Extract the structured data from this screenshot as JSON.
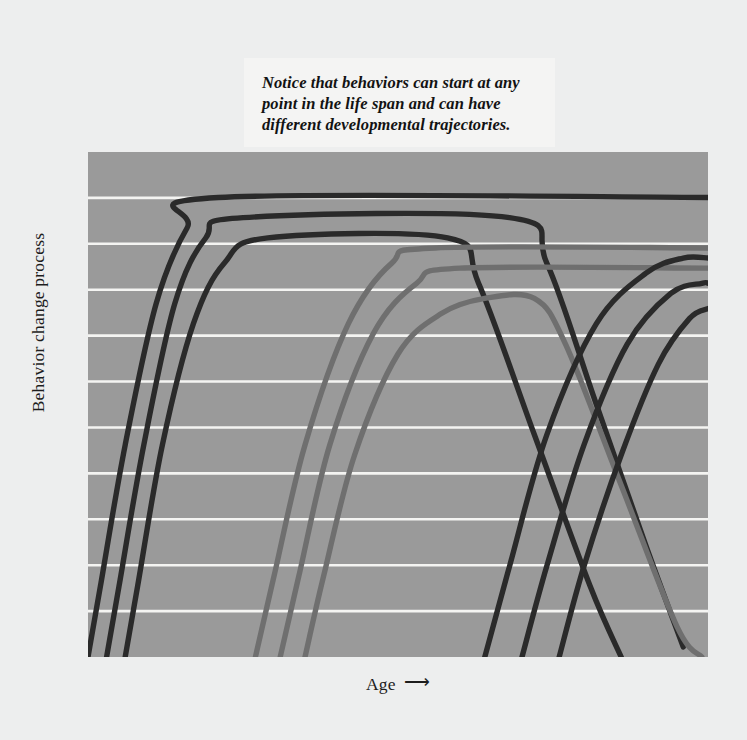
{
  "figure": {
    "background_color": "#edeeee",
    "plot_background_color": "#9a9a9a",
    "gridline_color": "#f4f4f2"
  },
  "axes": {
    "ylabel": "Behavior change process",
    "xlabel": "Age",
    "xlabel_arrow": "⟶"
  },
  "annotation": {
    "text": "Notice that behaviors can start at any point in the life span and can have different developmental trajectories."
  },
  "chart_data": {
    "type": "line",
    "title": "",
    "xlabel": "Age",
    "ylabel": "Behavior change process",
    "xlim": [
      0,
      100
    ],
    "ylim": [
      0,
      100
    ],
    "grid": true,
    "gridlines_horizontal": 10,
    "legend": "none",
    "axis_ticks_shown": false,
    "colors": {
      "dark_curve": "#2a2a2a",
      "gray_curve": "#6f6f6f",
      "plot_area": "#9a9a9a",
      "grid": "#f4f4f2"
    },
    "series": [
      {
        "name": "early-onset-1",
        "color": "#2a2a2a",
        "cluster": "early",
        "points": [
          [
            0,
            0
          ],
          [
            2,
            14
          ],
          [
            6,
            42
          ],
          [
            11,
            70
          ],
          [
            16,
            85
          ],
          [
            21,
            91
          ],
          [
            100,
            91
          ]
        ]
      },
      {
        "name": "early-onset-2",
        "color": "#2a2a2a",
        "cluster": "early",
        "points": [
          [
            3,
            0
          ],
          [
            5,
            14
          ],
          [
            9,
            42
          ],
          [
            14,
            70
          ],
          [
            19,
            83
          ],
          [
            25,
            87
          ],
          [
            68,
            87
          ],
          [
            74,
            78
          ],
          [
            82,
            50
          ],
          [
            90,
            22
          ],
          [
            96,
            2
          ]
        ]
      },
      {
        "name": "early-onset-3",
        "color": "#2a2a2a",
        "cluster": "early",
        "points": [
          [
            6,
            0
          ],
          [
            8,
            14
          ],
          [
            12,
            42
          ],
          [
            17,
            66
          ],
          [
            22,
            78
          ],
          [
            29,
            83
          ],
          [
            58,
            83
          ],
          [
            63,
            74
          ],
          [
            72,
            44
          ],
          [
            81,
            14
          ],
          [
            86,
            0
          ]
        ]
      },
      {
        "name": "mid-onset-1",
        "color": "#6f6f6f",
        "cluster": "middle",
        "points": [
          [
            27,
            0
          ],
          [
            30,
            16
          ],
          [
            35,
            42
          ],
          [
            42,
            66
          ],
          [
            49,
            78
          ],
          [
            56,
            81
          ],
          [
            100,
            81
          ]
        ]
      },
      {
        "name": "mid-onset-2",
        "color": "#6f6f6f",
        "cluster": "middle",
        "points": [
          [
            31,
            0
          ],
          [
            34,
            16
          ],
          [
            39,
            42
          ],
          [
            46,
            64
          ],
          [
            53,
            74
          ],
          [
            60,
            77
          ],
          [
            100,
            77
          ]
        ]
      },
      {
        "name": "mid-onset-3",
        "color": "#6f6f6f",
        "cluster": "middle",
        "points": [
          [
            35,
            0
          ],
          [
            38,
            16
          ],
          [
            43,
            40
          ],
          [
            50,
            60
          ],
          [
            57,
            68
          ],
          [
            64,
            71
          ],
          [
            72,
            71
          ],
          [
            77,
            62
          ],
          [
            86,
            34
          ],
          [
            95,
            6
          ],
          [
            99,
            0
          ]
        ]
      },
      {
        "name": "late-onset-1",
        "color": "#2a2a2a",
        "cluster": "late",
        "points": [
          [
            64,
            0
          ],
          [
            68,
            18
          ],
          [
            74,
            44
          ],
          [
            82,
            66
          ],
          [
            90,
            76
          ],
          [
            96,
            79
          ],
          [
            100,
            79
          ]
        ]
      },
      {
        "name": "late-onset-2",
        "color": "#2a2a2a",
        "cluster": "late",
        "points": [
          [
            70,
            0
          ],
          [
            74,
            18
          ],
          [
            80,
            42
          ],
          [
            87,
            62
          ],
          [
            94,
            72
          ],
          [
            99,
            74
          ],
          [
            100,
            74
          ]
        ]
      },
      {
        "name": "late-onset-3",
        "color": "#2a2a2a",
        "cluster": "late",
        "points": [
          [
            76,
            0
          ],
          [
            80,
            18
          ],
          [
            86,
            40
          ],
          [
            92,
            58
          ],
          [
            97,
            67
          ],
          [
            100,
            69
          ]
        ]
      }
    ]
  }
}
